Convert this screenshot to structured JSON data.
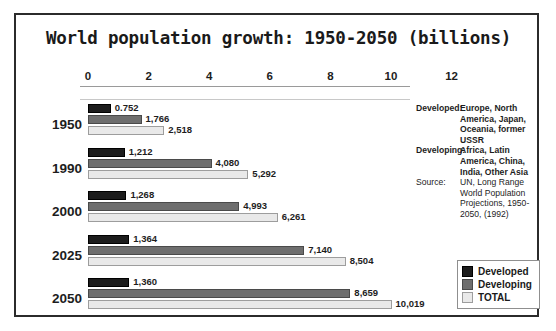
{
  "chart_data": {
    "type": "bar",
    "title": "World population growth: 1950-2050 (billions)",
    "orientation": "horizontal",
    "grouped": true,
    "xlabel": "",
    "ylabel": "",
    "xlim": [
      0,
      13
    ],
    "xticks": [
      0,
      2,
      4,
      6,
      8,
      10,
      12
    ],
    "xtick_labels": [
      "0",
      "2",
      "4",
      "6",
      "8",
      "10",
      "12"
    ],
    "grid": false,
    "legend_position": "bottom-right",
    "categories": [
      "1950",
      "1990",
      "2000",
      "2025",
      "2050"
    ],
    "series": [
      {
        "name": "Developed",
        "color": "#1c1c1c",
        "values": [
          0.752,
          1.212,
          1.268,
          1.364,
          1.36
        ],
        "labels": [
          "0.752",
          "1,212",
          "1,268",
          "1,364",
          "1,360"
        ]
      },
      {
        "name": "Developing",
        "color": "#6e6e6e",
        "values": [
          1.766,
          4.08,
          4.993,
          7.14,
          8.659
        ],
        "labels": [
          "1,766",
          "4,080",
          "4,993",
          "7,140",
          "8,659"
        ]
      },
      {
        "name": "TOTAL",
        "color": "#e9e9e9",
        "values": [
          2.518,
          5.292,
          6.261,
          8.504,
          10.019
        ],
        "labels": [
          "2,518",
          "5,292",
          "6,261",
          "8,504",
          "10,019"
        ]
      }
    ]
  },
  "notes": [
    {
      "label": "Developed:",
      "text": "Europe, North America, Japan, Oceania, former USSR",
      "bold": true
    },
    {
      "label": "Developing:",
      "text": "Africa, Latin America, China, India, Other Asia",
      "bold": true
    },
    {
      "label": "Source:",
      "text": "UN, Long Range World Population Projections, 1950-2050, (1992)",
      "bold": false
    }
  ],
  "legend": {
    "items": [
      {
        "label": "Developed",
        "color": "#1c1c1c"
      },
      {
        "label": "Developing",
        "color": "#6e6e6e"
      },
      {
        "label": "TOTAL",
        "color": "#e9e9e9"
      }
    ]
  }
}
